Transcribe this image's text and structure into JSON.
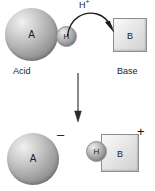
{
  "diagram": {
    "background_color": "#ffffff",
    "ink_color": "#1d1d1d",
    "top_row": {
      "acid": {
        "sphere_label": "A",
        "caption": "Acid",
        "proton_label": "H"
      },
      "transfer": {
        "label": "H",
        "charge_superscript": "+",
        "arrow": "curved-arrow-right"
      },
      "base": {
        "square_label": "B",
        "caption": "Base"
      }
    },
    "reaction_arrow": {
      "direction": "down",
      "name": "vertical-reaction-arrow"
    },
    "bottom_row": {
      "conjugate_base": {
        "sphere_label": "A",
        "charge": "–"
      },
      "conjugate_acid": {
        "proton_label": "H",
        "square_label": "B",
        "charge": "+"
      }
    }
  }
}
